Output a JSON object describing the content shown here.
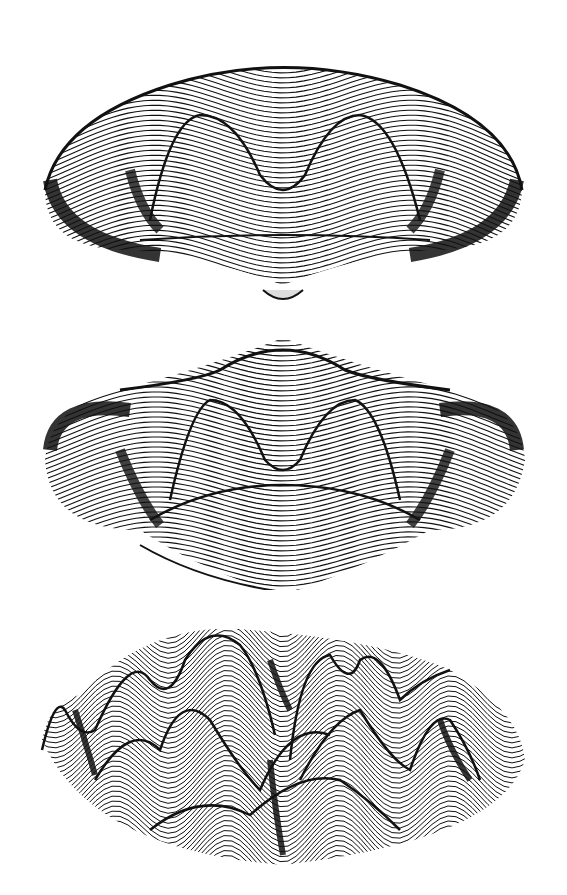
{
  "figure": {
    "panels": [
      {
        "id": "top",
        "shape": "saddle surface with two central peaks",
        "top": 40,
        "height": 280
      },
      {
        "id": "middle",
        "shape": "saddle surface with two central peaks and raised rim",
        "top": 330,
        "height": 260
      },
      {
        "id": "bottom",
        "shape": "multi-peak wavy surface on circular domain",
        "top": 600,
        "height": 280
      }
    ],
    "colors": {
      "ink": "#111111",
      "paper": "#ffffff"
    }
  }
}
